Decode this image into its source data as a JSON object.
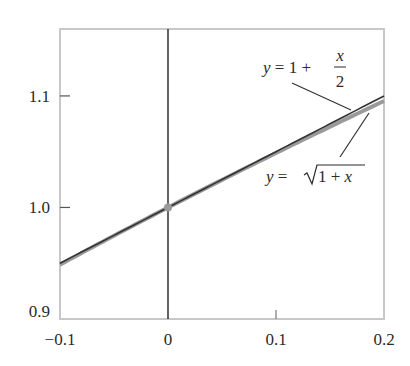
{
  "chart_data": {
    "type": "line",
    "title": "",
    "xlabel": "",
    "ylabel": "",
    "xlim": [
      -0.1,
      0.2
    ],
    "ylim": [
      0.9,
      1.16
    ],
    "grid": false,
    "x_ticks": [
      {
        "value": -0.1,
        "label": "−0.1"
      },
      {
        "value": 0,
        "label": "0"
      },
      {
        "value": 0.1,
        "label": "0.1"
      },
      {
        "value": 0.2,
        "label": "0.2"
      }
    ],
    "y_ticks": [
      {
        "value": 0.9,
        "label": "0.9"
      },
      {
        "value": 1.0,
        "label": "1.0"
      },
      {
        "value": 1.1,
        "label": "1.1"
      }
    ],
    "series": [
      {
        "name": "y = √(1 + x)",
        "function": "sqrt(1+x)",
        "x": [
          -0.1,
          -0.05,
          0,
          0.05,
          0.1,
          0.15,
          0.2
        ],
        "values": [
          0.9487,
          0.9747,
          1.0,
          1.0247,
          1.0488,
          1.0724,
          1.0954
        ],
        "color": "#9a9a9a"
      },
      {
        "name": "y = 1 + x/2",
        "function": "1+x/2",
        "x": [
          -0.1,
          0,
          0.1,
          0.2
        ],
        "values": [
          0.95,
          1.0,
          1.05,
          1.1
        ],
        "color": "#333333"
      }
    ],
    "points": [
      {
        "x": 0,
        "y": 1.0,
        "color": "#9a9a9a",
        "label": "point of tangency"
      }
    ],
    "annotations": [
      {
        "text_parts": {
          "lhs": "y",
          "eq": " = 1 + ",
          "num": "x",
          "den": "2"
        },
        "series": "y = 1 + x/2",
        "label_pos": [
          263,
          80
        ],
        "leader_from": [
          292,
          83
        ],
        "leader_to": [
          351,
          110
        ]
      },
      {
        "text_parts": {
          "lhs": "y",
          "eq": " = ",
          "rad": "1 + ",
          "var": "x"
        },
        "series": "y = √(1 + x)",
        "label_pos": [
          266,
          182
        ],
        "leader_from": [
          340,
          157
        ],
        "leader_to": [
          369,
          113
        ]
      }
    ],
    "vertical_line": {
      "x": 0,
      "color": "#222222"
    }
  },
  "layout": {
    "plot_px": {
      "left": 60,
      "top": 29,
      "right": 384,
      "bottom": 319
    },
    "frame_color": "#c8c8c8",
    "axis_color": "#222222"
  }
}
